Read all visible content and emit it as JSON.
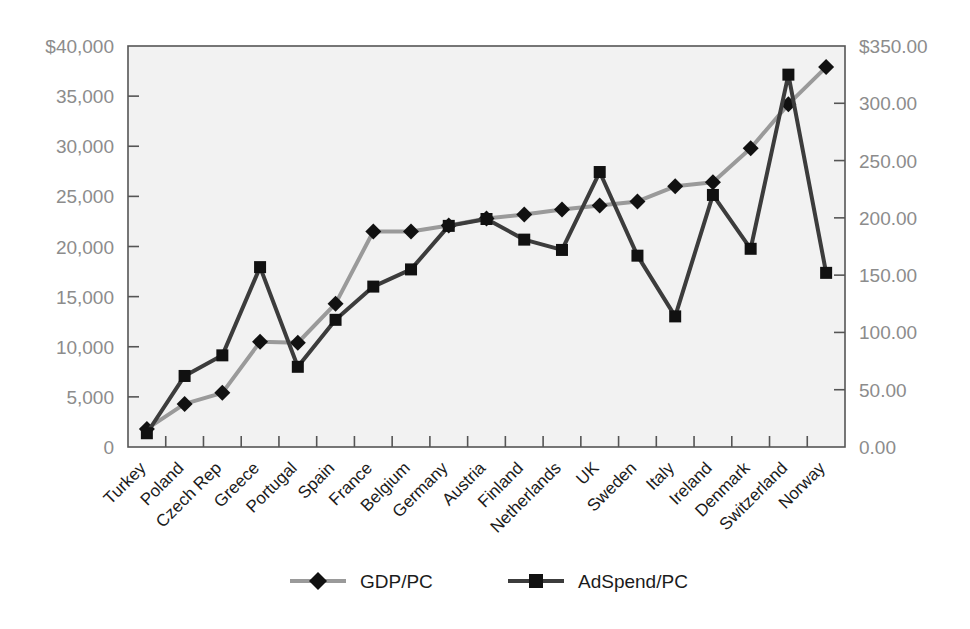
{
  "chart_data": {
    "type": "line",
    "title": "",
    "subtitle": "",
    "xlabel": "",
    "ylabel": "",
    "grid": false,
    "legend_position": "bottom",
    "categories": [
      "Turkey",
      "Poland",
      "Czech Rep",
      "Greece",
      "Portugal",
      "Spain",
      "France",
      "Belgium",
      "Germany",
      "Austria",
      "Finland",
      "Netherlands",
      "UK",
      "Sweden",
      "Italy",
      "Ireland",
      "Denmark",
      "Switzerland",
      "Norway"
    ],
    "series": [
      {
        "name": "GDP/PC",
        "axis": "left",
        "color": "#9a9a9a",
        "marker": "diamond",
        "marker_color": "#111111",
        "values": [
          1800,
          4300,
          5400,
          10500,
          10400,
          14300,
          21500,
          21500,
          22100,
          22800,
          23200,
          23700,
          24100,
          24500,
          26000,
          26400,
          29800,
          34200,
          37900
        ]
      },
      {
        "name": "AdSpend/PC",
        "axis": "right",
        "color": "#3c3c3c",
        "marker": "square",
        "marker_color": "#111111",
        "values": [
          12,
          62,
          80,
          157,
          70,
          111,
          140,
          155,
          193,
          199,
          181,
          172,
          240,
          167,
          114,
          220,
          173,
          325,
          152
        ]
      }
    ],
    "left_axis": {
      "min": 0,
      "max": 40000,
      "step": 5000,
      "ticks": [
        "$40,000",
        "35,000",
        "30,000",
        "25,000",
        "20,000",
        "15,000",
        "10,000",
        "5,000",
        "0"
      ],
      "tick_values": [
        40000,
        35000,
        30000,
        25000,
        20000,
        15000,
        10000,
        5000,
        0
      ]
    },
    "right_axis": {
      "min": 0,
      "max": 350,
      "step": 50,
      "ticks": [
        "$350.00",
        "300.00",
        "250.00",
        "200.00",
        "150.00",
        "100.00",
        "50.00",
        "0.00"
      ],
      "tick_values": [
        350,
        300,
        250,
        200,
        150,
        100,
        50,
        0
      ]
    },
    "legend": [
      {
        "label": "GDP/PC",
        "line_color": "#9a9a9a",
        "marker": "diamond"
      },
      {
        "label": "AdSpend/PC",
        "line_color": "#3c3c3c",
        "marker": "square"
      }
    ],
    "plot_background": "#f2f2f2",
    "border_color": "#555555"
  }
}
